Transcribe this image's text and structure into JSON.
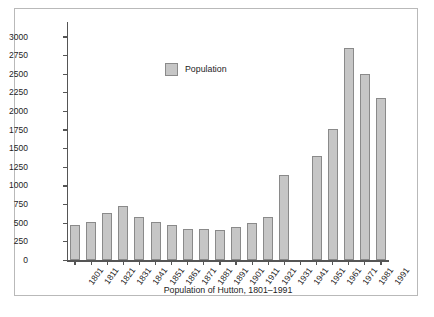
{
  "chart_data": {
    "type": "bar",
    "title": "Population of Hutton, 1801–1991",
    "xlabel": "Population of Hutton, 1801–1991",
    "ylabel": "",
    "ylim": [
      0,
      3000
    ],
    "ytick_step": 250,
    "grid": false,
    "legend": {
      "position": "upper-left-inside",
      "entries": [
        "Population"
      ]
    },
    "categories": [
      "1801",
      "1811",
      "1821",
      "1831",
      "1841",
      "1851",
      "1861",
      "1871",
      "1881",
      "1891",
      "1901",
      "1911",
      "1921",
      "1931",
      "1941",
      "1951",
      "1961",
      "1971",
      "1981",
      "1991"
    ],
    "ytick_labels": [
      "3000",
      "2750",
      "2500",
      "2250",
      "2000",
      "1750",
      "1500",
      "1250",
      "1000",
      "750",
      "500",
      "250",
      "0"
    ],
    "ytick_values": [
      3000,
      2750,
      2500,
      2250,
      2000,
      1750,
      1500,
      1250,
      1000,
      750,
      500,
      250,
      0
    ],
    "series": [
      {
        "name": "Population",
        "color": "#c6c6c6",
        "edge_color": "#8a8a8a",
        "values": [
          480,
          520,
          635,
          728,
          585,
          522,
          480,
          420,
          420,
          410,
          450,
          505,
          585,
          1150,
          null,
          1405,
          1760,
          2850,
          2505,
          2180
        ]
      }
    ]
  }
}
